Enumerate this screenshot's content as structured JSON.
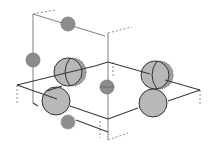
{
  "diagram": {
    "type": "crystal-unit-cell",
    "background": "#ffffff",
    "colors": {
      "edge": "#3a3a3a",
      "edge_light": "#8a8a8a",
      "dashed": "#8a8a8a",
      "atom_large_fill": "#b8b8b8",
      "atom_large_stroke": "#333333",
      "atom_small_fill": "#8c8c8c",
      "atom_small_stroke": "#777777"
    },
    "edges": [
      {
        "id": "back-vertical",
        "x1": 33,
        "y1": 14,
        "x2": 33,
        "y2": 103,
        "style": "light"
      },
      {
        "id": "top-edge",
        "x1": 33,
        "y1": 14,
        "x2": 105,
        "y2": 36,
        "style": "light"
      },
      {
        "id": "right-vertical",
        "x1": 108,
        "y1": 33,
        "x2": 108,
        "y2": 140,
        "style": "light"
      },
      {
        "id": "mid-left-back",
        "x1": 17,
        "y1": 85,
        "x2": 70,
        "y2": 72,
        "style": "solid"
      },
      {
        "id": "mid-back-left",
        "x1": 70,
        "y1": 72,
        "x2": 95,
        "y2": 66,
        "style": "solid"
      },
      {
        "id": "mid-back-right",
        "x1": 95,
        "y1": 66,
        "x2": 108,
        "y2": 62,
        "style": "solid"
      },
      {
        "id": "mid-right-back",
        "x1": 108,
        "y1": 62,
        "x2": 150,
        "y2": 74,
        "style": "solid"
      },
      {
        "id": "mid-right-front",
        "x1": 165,
        "y1": 80,
        "x2": 200,
        "y2": 90,
        "style": "solid"
      },
      {
        "id": "mid-front-right",
        "x1": 168,
        "y1": 101,
        "x2": 200,
        "y2": 90,
        "style": "solid"
      },
      {
        "id": "mid-left-front",
        "x1": 17,
        "y1": 85,
        "x2": 57,
        "y2": 99,
        "style": "solid"
      },
      {
        "id": "mid-center-front",
        "x1": 70,
        "y1": 106,
        "x2": 108,
        "y2": 119,
        "style": "solid"
      },
      {
        "id": "mid-center-right",
        "x1": 108,
        "y1": 119,
        "x2": 138,
        "y2": 108,
        "style": "solid"
      },
      {
        "id": "bottom-left",
        "x1": 33,
        "y1": 103,
        "x2": 38,
        "y2": 106,
        "style": "solid"
      },
      {
        "id": "bottom-front",
        "x1": 76,
        "y1": 120,
        "x2": 108,
        "y2": 132,
        "style": "solid"
      },
      {
        "id": "mid-center-diag",
        "x1": 47,
        "y1": 91,
        "x2": 62,
        "y2": 86,
        "style": "solid"
      }
    ],
    "dashed_stubs": [
      {
        "id": "top-left-stub",
        "x1": 33,
        "y1": 14,
        "x2": 55,
        "y2": 10
      },
      {
        "id": "top-right-stub",
        "x1": 108,
        "y1": 33,
        "x2": 132,
        "y2": 27
      },
      {
        "id": "left-down-stub",
        "x1": 17,
        "y1": 85,
        "x2": 17,
        "y2": 103
      },
      {
        "id": "center-down-stub",
        "x1": 113,
        "y1": 62,
        "x2": 113,
        "y2": 78
      },
      {
        "id": "right-down-stub",
        "x1": 200,
        "y1": 90,
        "x2": 200,
        "y2": 104
      },
      {
        "id": "bottom-center-stub",
        "x1": 100,
        "y1": 121,
        "x2": 100,
        "y2": 138
      },
      {
        "id": "bottom-right-stub",
        "x1": 108,
        "y1": 140,
        "x2": 128,
        "y2": 133
      }
    ],
    "atoms": [
      {
        "id": "atom-top-small",
        "cx": 68,
        "cy": 24,
        "r": 7,
        "kind": "small"
      },
      {
        "id": "atom-left-small",
        "cx": 33,
        "cy": 60,
        "r": 7,
        "kind": "small"
      },
      {
        "id": "atom-center-small",
        "cx": 107,
        "cy": 87,
        "r": 7,
        "kind": "small-line"
      },
      {
        "id": "atom-bottom-small",
        "cx": 68,
        "cy": 122,
        "r": 7,
        "kind": "small-fuzzy"
      },
      {
        "id": "atom-mid-left-large",
        "cx": 68,
        "cy": 72,
        "r": 14,
        "kind": "large-half"
      },
      {
        "id": "atom-mid-right-large",
        "cx": 155,
        "cy": 75,
        "r": 14,
        "kind": "large-half"
      },
      {
        "id": "atom-front-left-large",
        "cx": 56,
        "cy": 101,
        "r": 14,
        "kind": "large"
      },
      {
        "id": "atom-front-right-large",
        "cx": 153,
        "cy": 103,
        "r": 14,
        "kind": "large"
      }
    ]
  }
}
